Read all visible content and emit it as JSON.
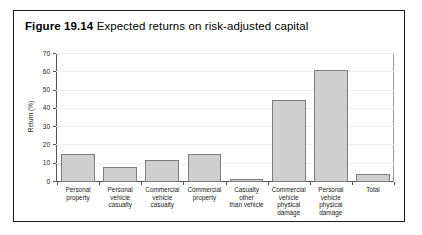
{
  "figure": {
    "label": "Figure 19.14",
    "caption": "Expected returns on risk-adjusted capital"
  },
  "chart_data": {
    "type": "bar",
    "title": "Expected returns on risk-adjusted capital",
    "xlabel": "",
    "ylabel": "Return (%)",
    "ylim": [
      0,
      70
    ],
    "ytick_step": 10,
    "yticks": [
      0,
      10,
      20,
      30,
      40,
      50,
      60,
      70
    ],
    "ytick_labels": [
      "0",
      "10",
      "20",
      "30",
      "40",
      "50",
      "60",
      "70"
    ],
    "grid": true,
    "legend": false,
    "bar_fill_color": "#cfcfcf",
    "bar_border_color": "#7d7d7d",
    "categories": [
      "Personal property",
      "Personal vehicle casualty",
      "Commercial vehicle casualty",
      "Commercial property",
      "Casualty other than vehicle",
      "Commercial vehicle physical damage",
      "Personal vehicle physical damage",
      "Total"
    ],
    "category_lines": [
      [
        "Personal",
        "property"
      ],
      [
        "Personal",
        "vehicle",
        "casualty"
      ],
      [
        "Commercial",
        "vehicle",
        "casualty"
      ],
      [
        "Commercial",
        "property"
      ],
      [
        "Casualty",
        "other",
        "than vehicle"
      ],
      [
        "Commercial",
        "vehicle physical",
        "damage"
      ],
      [
        "Personal vehicle",
        "physical",
        "damage"
      ],
      [
        "Total"
      ]
    ],
    "values": [
      15.5,
      8,
      12,
      15.5,
      1.5,
      45,
      61,
      4.5
    ]
  }
}
